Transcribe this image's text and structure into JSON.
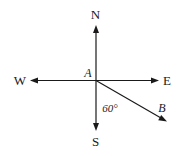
{
  "diagram": {
    "type": "compass-bearing",
    "origin_label": "A",
    "directions": {
      "north": "N",
      "south": "S",
      "east": "E",
      "west": "W"
    },
    "ray": {
      "label": "B",
      "angle_label": "60°",
      "angle_from": "S",
      "angle_degrees": 60
    },
    "colors": {
      "ink": "#1a1a1a",
      "background": "#ffffff"
    }
  }
}
